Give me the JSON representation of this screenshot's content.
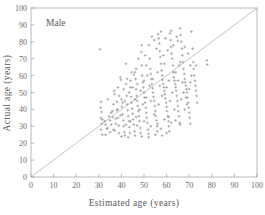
{
  "chart_data": {
    "type": "scatter",
    "title": "",
    "annotation": "Male",
    "xlabel": "Estimated age  (years)",
    "ylabel": "Actual age  (years)",
    "xlim": [
      0,
      100
    ],
    "ylim": [
      0,
      100
    ],
    "xticks": [
      0,
      10,
      20,
      30,
      40,
      50,
      60,
      70,
      80,
      90,
      100
    ],
    "yticks": [
      0,
      10,
      20,
      30,
      40,
      50,
      60,
      70,
      80,
      90,
      100
    ],
    "grid": false,
    "legend": "none",
    "marker": "plus",
    "marker_color": "#8e8e8e",
    "reference_line": {
      "name": "identity-line",
      "from": [
        0,
        0
      ],
      "to": [
        100,
        100
      ],
      "color": "#a8a8a8"
    },
    "series": [
      {
        "name": "Male subjects",
        "points": [
          [
            30.5,
            75.5
          ],
          [
            31.0,
            44.5
          ],
          [
            30.8,
            41.0
          ],
          [
            31.2,
            38.5
          ],
          [
            31.0,
            35.0
          ],
          [
            31.3,
            31.5
          ],
          [
            31.0,
            28.0
          ],
          [
            31.5,
            25.0
          ],
          [
            32.5,
            33.0
          ],
          [
            33.0,
            31.0
          ],
          [
            33.5,
            28.5
          ],
          [
            34.0,
            46.0
          ],
          [
            34.5,
            36.0
          ],
          [
            35.0,
            33.5
          ],
          [
            35.5,
            31.0
          ],
          [
            36.0,
            39.0
          ],
          [
            36.2,
            35.5
          ],
          [
            36.5,
            28.0
          ],
          [
            37.0,
            49.0
          ],
          [
            37.5,
            34.5
          ],
          [
            38.0,
            44.5
          ],
          [
            38.3,
            40.0
          ],
          [
            38.5,
            35.0
          ],
          [
            38.8,
            30.5
          ],
          [
            39.0,
            26.0
          ],
          [
            39.5,
            59.0
          ],
          [
            39.8,
            57.5
          ],
          [
            40.0,
            46.0
          ],
          [
            40.2,
            41.5
          ],
          [
            40.5,
            37.0
          ],
          [
            40.8,
            33.5
          ],
          [
            41.0,
            30.0
          ],
          [
            41.3,
            26.5
          ],
          [
            41.5,
            24.5
          ],
          [
            42.0,
            55.0
          ],
          [
            42.3,
            48.0
          ],
          [
            42.5,
            43.0
          ],
          [
            42.8,
            39.5
          ],
          [
            43.0,
            36.0
          ],
          [
            43.3,
            33.0
          ],
          [
            43.5,
            29.5
          ],
          [
            43.8,
            26.0
          ],
          [
            44.0,
            53.0
          ],
          [
            44.3,
            47.5
          ],
          [
            44.5,
            44.0
          ],
          [
            44.8,
            40.5
          ],
          [
            45.0,
            37.5
          ],
          [
            45.2,
            34.0
          ],
          [
            45.5,
            31.0
          ],
          [
            45.8,
            27.0
          ],
          [
            46.0,
            62.0
          ],
          [
            46.3,
            58.0
          ],
          [
            46.5,
            52.0
          ],
          [
            46.8,
            48.0
          ],
          [
            47.0,
            45.0
          ],
          [
            47.2,
            42.0
          ],
          [
            47.5,
            39.0
          ],
          [
            47.8,
            36.0
          ],
          [
            48.0,
            33.0
          ],
          [
            48.3,
            29.0
          ],
          [
            48.5,
            26.0
          ],
          [
            48.8,
            74.0
          ],
          [
            49.0,
            66.0
          ],
          [
            49.2,
            60.0
          ],
          [
            49.5,
            56.0
          ],
          [
            49.8,
            53.0
          ],
          [
            50.0,
            50.0
          ],
          [
            50.2,
            47.0
          ],
          [
            50.5,
            44.0
          ],
          [
            50.8,
            41.0
          ],
          [
            51.0,
            38.0
          ],
          [
            51.2,
            35.0
          ],
          [
            51.5,
            32.0
          ],
          [
            51.8,
            28.0
          ],
          [
            52.0,
            25.5
          ],
          [
            52.2,
            78.0
          ],
          [
            52.5,
            70.0
          ],
          [
            52.8,
            64.0
          ],
          [
            53.0,
            61.0
          ],
          [
            53.2,
            58.0
          ],
          [
            53.5,
            55.0
          ],
          [
            53.8,
            52.5
          ],
          [
            54.0,
            50.0
          ],
          [
            54.2,
            47.5
          ],
          [
            54.5,
            45.0
          ],
          [
            54.8,
            42.0
          ],
          [
            55.0,
            39.0
          ],
          [
            55.2,
            36.0
          ],
          [
            55.5,
            33.5
          ],
          [
            55.8,
            30.0
          ],
          [
            56.0,
            27.0
          ],
          [
            56.2,
            84.5
          ],
          [
            56.5,
            82.0
          ],
          [
            56.8,
            79.0
          ],
          [
            57.0,
            74.5
          ],
          [
            57.2,
            71.0
          ],
          [
            57.5,
            67.0
          ],
          [
            57.8,
            63.0
          ],
          [
            58.0,
            60.0
          ],
          [
            58.2,
            57.5
          ],
          [
            58.5,
            55.0
          ],
          [
            58.8,
            53.0
          ],
          [
            59.0,
            51.0
          ],
          [
            59.2,
            49.0
          ],
          [
            59.5,
            46.5
          ],
          [
            59.8,
            44.0
          ],
          [
            60.0,
            41.5
          ],
          [
            60.2,
            39.0
          ],
          [
            60.5,
            36.0
          ],
          [
            60.8,
            33.0
          ],
          [
            61.0,
            30.0
          ],
          [
            61.2,
            27.0
          ],
          [
            61.5,
            85.0
          ],
          [
            61.8,
            81.0
          ],
          [
            62.0,
            77.0
          ],
          [
            62.2,
            73.0
          ],
          [
            62.5,
            70.0
          ],
          [
            62.8,
            66.0
          ],
          [
            63.0,
            62.0
          ],
          [
            63.2,
            59.0
          ],
          [
            63.5,
            57.0
          ],
          [
            63.8,
            55.0
          ],
          [
            64.0,
            53.0
          ],
          [
            64.2,
            51.0
          ],
          [
            64.5,
            48.0
          ],
          [
            64.8,
            45.0
          ],
          [
            65.0,
            42.0
          ],
          [
            65.2,
            39.0
          ],
          [
            65.5,
            36.0
          ],
          [
            65.8,
            32.0
          ],
          [
            66.0,
            88.0
          ],
          [
            66.2,
            84.0
          ],
          [
            66.5,
            80.0
          ],
          [
            66.8,
            76.0
          ],
          [
            67.0,
            72.0
          ],
          [
            67.2,
            68.0
          ],
          [
            67.5,
            64.0
          ],
          [
            67.8,
            61.0
          ],
          [
            68.0,
            58.0
          ],
          [
            68.2,
            56.0
          ],
          [
            68.5,
            54.0
          ],
          [
            68.8,
            52.0
          ],
          [
            69.0,
            50.0
          ],
          [
            69.2,
            47.0
          ],
          [
            69.5,
            44.0
          ],
          [
            69.8,
            41.0
          ],
          [
            70.0,
            38.0
          ],
          [
            70.2,
            35.0
          ],
          [
            70.5,
            31.5
          ],
          [
            71.0,
            86.0
          ],
          [
            71.5,
            76.0
          ],
          [
            71.8,
            68.0
          ],
          [
            72.0,
            64.0
          ],
          [
            72.3,
            60.0
          ],
          [
            72.5,
            57.0
          ],
          [
            72.8,
            54.0
          ],
          [
            73.0,
            51.0
          ],
          [
            73.3,
            48.0
          ],
          [
            73.5,
            44.0
          ],
          [
            77.8,
            69.0
          ],
          [
            78.0,
            66.5
          ],
          [
            36.8,
            51.0
          ],
          [
            42.0,
            67.0
          ],
          [
            47.5,
            70.0
          ],
          [
            49.0,
            78.0
          ],
          [
            51.0,
            66.0
          ],
          [
            44.0,
            57.0
          ],
          [
            41.0,
            52.0
          ],
          [
            39.0,
            48.0
          ],
          [
            57.5,
            86.0
          ],
          [
            59.5,
            82.0
          ],
          [
            53.5,
            83.0
          ],
          [
            54.5,
            81.0
          ],
          [
            62.0,
            86.5
          ],
          [
            64.5,
            83.0
          ],
          [
            65.0,
            80.5
          ],
          [
            45.5,
            60.5
          ],
          [
            46.5,
            64.0
          ],
          [
            50.5,
            72.0
          ],
          [
            55.5,
            76.0
          ],
          [
            58.5,
            72.0
          ],
          [
            60.5,
            75.0
          ],
          [
            63.0,
            78.0
          ],
          [
            66.0,
            68.0
          ],
          [
            67.0,
            56.0
          ],
          [
            68.5,
            47.0
          ],
          [
            69.0,
            43.0
          ],
          [
            70.0,
            52.0
          ],
          [
            70.5,
            56.0
          ],
          [
            33.0,
            25.0
          ],
          [
            35.0,
            26.5
          ],
          [
            37.0,
            27.5
          ],
          [
            40.0,
            24.0
          ],
          [
            43.0,
            23.5
          ],
          [
            46.0,
            24.5
          ],
          [
            49.0,
            24.0
          ],
          [
            52.0,
            23.5
          ],
          [
            55.0,
            25.0
          ],
          [
            58.0,
            24.5
          ],
          [
            60.0,
            26.0
          ],
          [
            36.5,
            43.0
          ],
          [
            38.5,
            53.0
          ],
          [
            40.5,
            44.0
          ],
          [
            42.5,
            58.0
          ],
          [
            44.5,
            62.0
          ],
          [
            47.0,
            55.0
          ],
          [
            48.5,
            51.0
          ],
          [
            50.0,
            57.0
          ],
          [
            51.5,
            60.0
          ],
          [
            52.5,
            54.0
          ],
          [
            54.0,
            58.0
          ],
          [
            56.0,
            62.0
          ],
          [
            57.0,
            54.0
          ],
          [
            59.0,
            67.0
          ],
          [
            61.0,
            57.0
          ],
          [
            62.5,
            50.0
          ],
          [
            64.0,
            62.0
          ],
          [
            65.5,
            66.0
          ],
          [
            66.5,
            46.0
          ],
          [
            68.0,
            40.0
          ],
          [
            31.5,
            34.0
          ],
          [
            34.0,
            29.0
          ],
          [
            37.5,
            31.5
          ],
          [
            39.5,
            36.5
          ],
          [
            41.5,
            45.0
          ],
          [
            43.5,
            50.0
          ],
          [
            45.0,
            53.0
          ],
          [
            46.0,
            46.0
          ],
          [
            48.0,
            40.0
          ],
          [
            49.5,
            43.0
          ],
          [
            51.0,
            47.0
          ],
          [
            53.0,
            45.0
          ],
          [
            54.5,
            37.0
          ],
          [
            56.5,
            43.0
          ],
          [
            58.0,
            48.0
          ],
          [
            60.0,
            53.0
          ],
          [
            61.5,
            45.0
          ],
          [
            63.5,
            40.0
          ],
          [
            65.0,
            57.0
          ],
          [
            67.5,
            50.0
          ],
          [
            59.0,
            34.0
          ],
          [
            61.0,
            35.5
          ],
          [
            62.0,
            32.0
          ],
          [
            64.0,
            33.5
          ],
          [
            66.0,
            31.0
          ],
          [
            56.0,
            31.5
          ],
          [
            57.5,
            28.5
          ],
          [
            53.0,
            30.0
          ],
          [
            50.0,
            33.0
          ],
          [
            47.0,
            30.5
          ],
          [
            68.0,
            77.0
          ],
          [
            69.5,
            73.0
          ],
          [
            70.5,
            66.0
          ],
          [
            71.0,
            60.0
          ],
          [
            73.0,
            66.0
          ],
          [
            44.0,
            33.0
          ],
          [
            46.5,
            35.5
          ],
          [
            42.0,
            31.0
          ],
          [
            38.0,
            39.5
          ],
          [
            35.5,
            38.0
          ]
        ]
      }
    ]
  }
}
